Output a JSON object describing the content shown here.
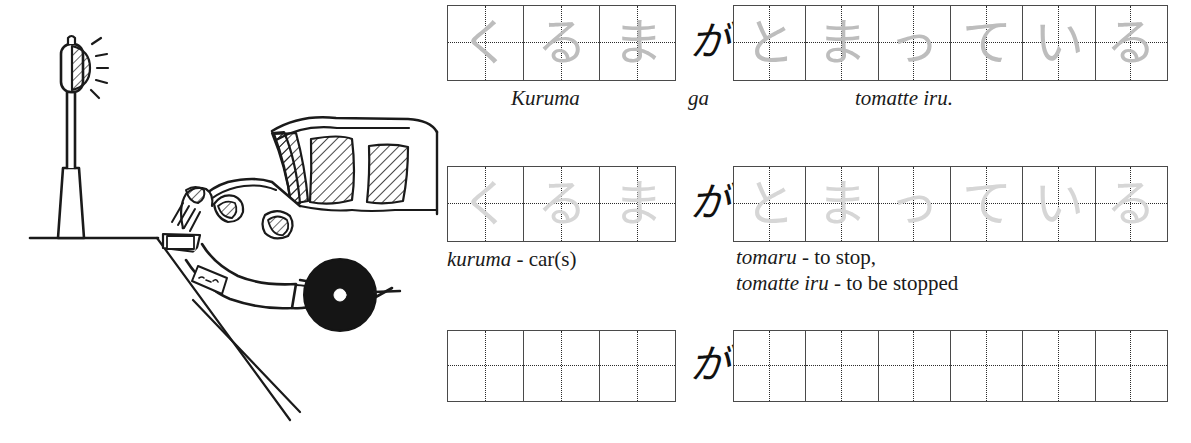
{
  "illustration": {
    "name": "car-stopped-at-traffic-light",
    "caption": "",
    "elements": [
      "traffic-light",
      "car",
      "road-line",
      "license-plate"
    ]
  },
  "worksheet": {
    "particle": "が",
    "particle_romaji": "ga",
    "rows": [
      {
        "id": "row-model",
        "style": "model",
        "left_grid": {
          "cells": [
            "く",
            "る",
            "ま"
          ],
          "caption": "Kuruma",
          "caption_style": "italic"
        },
        "right_grid": {
          "cells": [
            "と",
            "ま",
            "っ",
            "て",
            "い",
            "る"
          ],
          "caption": "tomatte iru.",
          "caption_style": "italic"
        }
      },
      {
        "id": "row-trace",
        "style": "trace",
        "left_grid": {
          "cells": [
            "く",
            "る",
            "ま"
          ],
          "caption_italic": "kuruma",
          "caption_roman": " - car(s)"
        },
        "right_grid": {
          "cells": [
            "と",
            "ま",
            "っ",
            "て",
            "い",
            "る"
          ],
          "caption_line1_italic": "tomaru",
          "caption_line1_roman": " - to stop,",
          "caption_line2_italic": "tomatte iru",
          "caption_line2_roman": " - to be stopped"
        }
      },
      {
        "id": "row-blank",
        "style": "blank",
        "left_grid": {
          "cells": [
            "",
            "",
            ""
          ],
          "caption": ""
        },
        "right_grid": {
          "cells": [
            "",
            "",
            "",
            "",
            "",
            ""
          ],
          "caption": ""
        }
      }
    ]
  },
  "colors": {
    "ink": "#1a1a1a",
    "grid_border": "#4a4a4a",
    "guide_dots": "#2b2b2b",
    "model_glyph": "#bdbdbd",
    "trace_glyph": "#d6d6d6",
    "paper": "#ffffff"
  }
}
